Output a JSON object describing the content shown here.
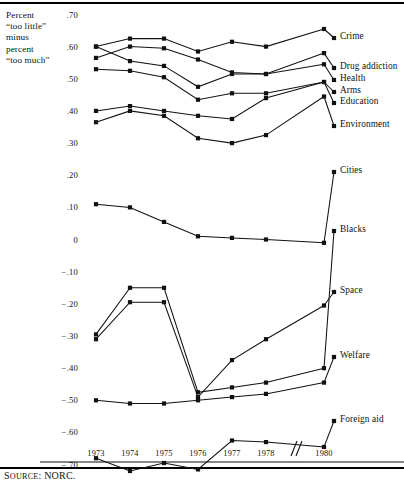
{
  "figure": {
    "y_axis_caption_lines": [
      "Percent",
      "“too little”",
      "minus",
      "percent",
      "“too much”"
    ],
    "source_prefix": "S",
    "source_smallcaps": "OURCE",
    "source_rest": ": NORC."
  },
  "chart_data": {
    "type": "line",
    "title": "",
    "xlabel": "",
    "ylabel": "Percent “too little” minus percent “too much”",
    "x": [
      "1973",
      "1974",
      "1975",
      "1976",
      "1977",
      "1978",
      "1980"
    ],
    "x_axis_break_after": "1978",
    "ylim": [
      -0.75,
      0.72
    ],
    "yticks": [
      0.7,
      0.6,
      0.5,
      0.4,
      0.3,
      0.2,
      0.1,
      0.0,
      -0.1,
      -0.2,
      -0.3,
      -0.4,
      -0.5,
      -0.6,
      -0.7
    ],
    "ytick_labels": [
      ".70",
      ".60",
      ".50",
      ".40",
      ".30",
      ".20",
      ".10",
      "0",
      "−.10",
      "−.20",
      "−.30",
      "−.40",
      "−.50",
      "−.60",
      "−.70"
    ],
    "grid": false,
    "legend_position": "right-inline-labels",
    "marker": "filled-square",
    "series": [
      {
        "name": "Crime",
        "values": [
          0.6,
          0.625,
          0.625,
          0.585,
          0.615,
          0.6,
          0.655
        ]
      },
      {
        "name": "Drug addiction",
        "values": [
          0.565,
          0.6,
          0.595,
          0.56,
          0.52,
          0.515,
          0.58
        ]
      },
      {
        "name": "Health",
        "values": [
          0.6,
          0.555,
          0.54,
          0.475,
          0.515,
          0.515,
          0.545
        ]
      },
      {
        "name": "Arms",
        "values": [
          0.53,
          0.525,
          0.505,
          0.435,
          0.455,
          0.455,
          0.49
        ]
      },
      {
        "name": "Education",
        "values": [
          0.4,
          0.415,
          0.4,
          0.385,
          0.375,
          0.44,
          0.49
        ]
      },
      {
        "name": "Environment",
        "values": [
          0.365,
          0.4,
          0.385,
          0.315,
          0.3,
          0.325,
          0.445
        ]
      },
      {
        "name": "Cities",
        "values": [
          0.11,
          0.1,
          0.055,
          0.01,
          0.005,
          0.0,
          -0.01
        ]
      },
      {
        "name": "Blacks",
        "values": [
          -0.295,
          -0.15,
          -0.15,
          -0.475,
          -0.46,
          -0.445,
          -0.4
        ]
      },
      {
        "name": "Space",
        "values": [
          -0.31,
          -0.195,
          -0.195,
          -0.49,
          -0.375,
          -0.31,
          -0.205
        ]
      },
      {
        "name": "Welfare",
        "values": [
          -0.5,
          -0.51,
          -0.51,
          -0.5,
          -0.49,
          -0.48,
          -0.445
        ]
      },
      {
        "name": "Foreign aid",
        "values": [
          -0.68,
          -0.72,
          -0.695,
          -0.715,
          -0.625,
          -0.63,
          -0.645
        ]
      }
    ],
    "series_label_anchor_index": 6
  },
  "series_labels": [
    {
      "name": "Crime",
      "x": 340,
      "y": 38
    },
    {
      "name": "Drug addiction",
      "x": 340,
      "y": 68
    },
    {
      "name": "Health",
      "x": 340,
      "y": 80
    },
    {
      "name": "Arms",
      "x": 340,
      "y": 92
    },
    {
      "name": "Education",
      "x": 340,
      "y": 103
    },
    {
      "name": "Environment",
      "x": 340,
      "y": 126
    },
    {
      "name": "Cities",
      "x": 340,
      "y": 172
    },
    {
      "name": "Blacks",
      "x": 340,
      "y": 231
    },
    {
      "name": "Space",
      "x": 340,
      "y": 292
    },
    {
      "name": "Welfare",
      "x": 340,
      "y": 357
    },
    {
      "name": "Foreign aid",
      "x": 340,
      "y": 421
    }
  ]
}
